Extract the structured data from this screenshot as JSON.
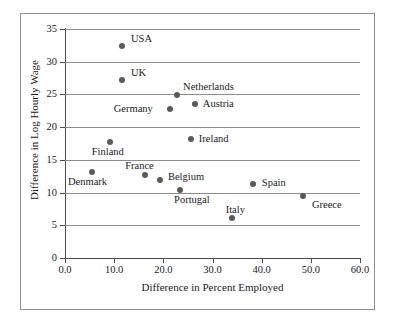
{
  "chart_data": {
    "type": "scatter",
    "title": "",
    "xlabel": "Difference in Percent Employed",
    "ylabel": "Difference in Log Hourly Wage",
    "xlim": [
      0.0,
      60.0
    ],
    "ylim": [
      0,
      35
    ],
    "xticks": [
      "0.0",
      "10.0",
      "20.0",
      "30.0",
      "40.0",
      "50.0",
      "60.0"
    ],
    "yticks": [
      "0",
      "5",
      "10",
      "15",
      "20",
      "25",
      "30",
      "35"
    ],
    "grid": "horizontal",
    "legend": "none",
    "marker_color": "#5a5a5a",
    "points": [
      {
        "label": "USA",
        "x": 11.6,
        "y": 32.4
      },
      {
        "label": "UK",
        "x": 11.6,
        "y": 27.2
      },
      {
        "label": "Netherlands",
        "x": 22.8,
        "y": 24.9
      },
      {
        "label": "Austria",
        "x": 26.4,
        "y": 23.5
      },
      {
        "label": "Germany",
        "x": 21.3,
        "y": 22.8
      },
      {
        "label": "Ireland",
        "x": 25.6,
        "y": 18.2
      },
      {
        "label": "Finland",
        "x": 9.1,
        "y": 17.7
      },
      {
        "label": "Denmark",
        "x": 5.5,
        "y": 13.1
      },
      {
        "label": "France",
        "x": 16.3,
        "y": 12.7
      },
      {
        "label": "Belgium",
        "x": 19.3,
        "y": 11.9
      },
      {
        "label": "Spain",
        "x": 38.2,
        "y": 11.3
      },
      {
        "label": "Portugal",
        "x": 23.4,
        "y": 10.4
      },
      {
        "label": "Greece",
        "x": 48.4,
        "y": 9.5
      },
      {
        "label": "Italy",
        "x": 33.9,
        "y": 6.1
      }
    ],
    "label_offsets": [
      {
        "label": "USA",
        "dx": 9,
        "dy": -13
      },
      {
        "label": "UK",
        "dx": 9,
        "dy": -13
      },
      {
        "label": "Netherlands",
        "dx": 6,
        "dy": -14
      },
      {
        "label": "Austria",
        "dx": 8,
        "dy": -6
      },
      {
        "label": "Germany",
        "dx": -56,
        "dy": -6
      },
      {
        "label": "Ireland",
        "dx": 8,
        "dy": -6
      },
      {
        "label": "Finland",
        "dx": -18,
        "dy": 4
      },
      {
        "label": "Denmark",
        "dx": -24,
        "dy": 4
      },
      {
        "label": "France",
        "dx": -20,
        "dy": -15
      },
      {
        "label": "Belgium",
        "dx": 8,
        "dy": -9
      },
      {
        "label": "Spain",
        "dx": 9,
        "dy": -7
      },
      {
        "label": "Portugal",
        "dx": -6,
        "dy": 4
      },
      {
        "label": "Greece",
        "dx": 9,
        "dy": 3
      },
      {
        "label": "Italy",
        "dx": -6,
        "dy": -14
      }
    ]
  }
}
